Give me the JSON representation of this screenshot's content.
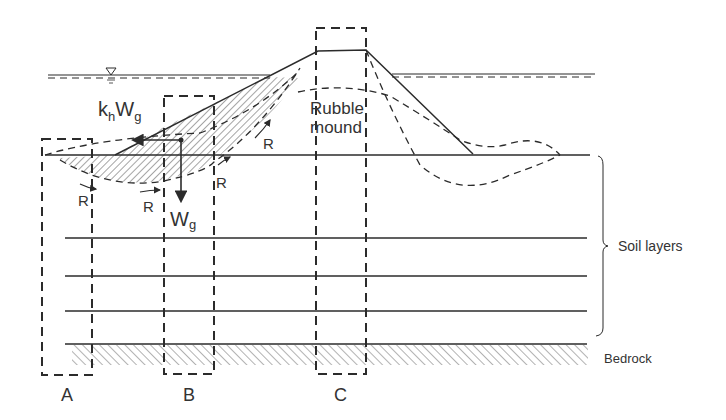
{
  "figure": {
    "labels": {
      "force_horizontal_main": "k",
      "force_horizontal_sub": "h",
      "force_horizontal_w": "W",
      "force_horizontal_wsub": "g",
      "weight_main": "W",
      "weight_sub": "g",
      "resistance": "R",
      "rubble_mound_line1": "Rubble",
      "rubble_mound_line2": "mound",
      "soil_layers": "Soil layers",
      "bedrock": "Bedrock",
      "box_a": "A",
      "box_b": "B",
      "box_c": "C"
    },
    "colors": {
      "line": "#2b2b2b",
      "text": "#333333",
      "background": "#ffffff"
    }
  }
}
